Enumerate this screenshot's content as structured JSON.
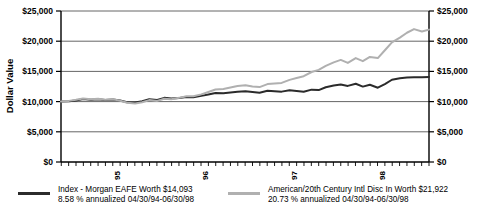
{
  "chart_data": {
    "type": "line",
    "title": "",
    "xlabel": "",
    "ylabel": "Dollar Value",
    "ylim": [
      0,
      25000
    ],
    "yticks": [
      0,
      5000,
      10000,
      15000,
      20000,
      25000
    ],
    "ytick_labels": [
      "$0",
      "$5,000",
      "$10,000",
      "$15,000",
      "$20,000",
      "$25,000"
    ],
    "right_axis": {
      "visible": true,
      "ytick_labels": [
        "$0",
        "$5,000",
        "$10,000",
        "$15,000",
        "$20,000",
        "$25,000"
      ]
    },
    "xlim": [
      1994.33,
      1998.5
    ],
    "xticks": [
      1995,
      1996,
      1997,
      1998
    ],
    "xtick_labels": [
      "95",
      "96",
      "97",
      "98"
    ],
    "xtick_rotation": -90,
    "minor_xticks_interval_months": 1,
    "grid": "horizontal",
    "legend_position": "below",
    "period_start": "04/30/94",
    "period_end": "06/30/98",
    "series": [
      {
        "name": "Index - Morgan EAFE",
        "color": "#2b2b2b",
        "width": 2.0,
        "final_value": 14093,
        "annualized_return": "8.58 %",
        "x": [
          1994.33,
          1994.42,
          1994.5,
          1994.58,
          1994.67,
          1994.75,
          1994.83,
          1994.92,
          1995.0,
          1995.08,
          1995.17,
          1995.25,
          1995.33,
          1995.42,
          1995.5,
          1995.58,
          1995.67,
          1995.75,
          1995.83,
          1995.92,
          1996.0,
          1996.08,
          1996.17,
          1996.25,
          1996.33,
          1996.42,
          1996.5,
          1996.58,
          1996.67,
          1996.75,
          1996.83,
          1996.92,
          1997.0,
          1997.08,
          1997.17,
          1997.25,
          1997.33,
          1997.42,
          1997.5,
          1997.58,
          1997.67,
          1997.75,
          1997.83,
          1997.92,
          1998.0,
          1998.08,
          1998.17,
          1998.25,
          1998.33,
          1998.42,
          1998.5
        ],
        "values": [
          10000,
          10050,
          10180,
          10420,
          10300,
          10380,
          10250,
          10330,
          10180,
          9900,
          9850,
          10050,
          10380,
          10280,
          10620,
          10500,
          10600,
          10780,
          10700,
          10950,
          11180,
          11420,
          11380,
          11500,
          11620,
          11700,
          11580,
          11480,
          11800,
          11720,
          11650,
          11880,
          11750,
          11620,
          11980,
          11900,
          12380,
          12680,
          12820,
          12600,
          12950,
          12480,
          12780,
          12300,
          12900,
          13620,
          13850,
          13980,
          14020,
          14050,
          14093
        ]
      },
      {
        "name": "American/20th Century Intl Disc In",
        "color": "#b0b0b0",
        "width": 2.0,
        "final_value": 21922,
        "annualized_return": "20.73 %",
        "x": [
          1994.33,
          1994.42,
          1994.5,
          1994.58,
          1994.67,
          1994.75,
          1994.83,
          1994.92,
          1995.0,
          1995.08,
          1995.17,
          1995.25,
          1995.33,
          1995.42,
          1995.5,
          1995.58,
          1995.67,
          1995.75,
          1995.83,
          1995.92,
          1996.0,
          1996.08,
          1996.17,
          1996.25,
          1996.33,
          1996.42,
          1996.5,
          1996.58,
          1996.67,
          1996.75,
          1996.83,
          1996.92,
          1997.0,
          1997.08,
          1997.17,
          1997.25,
          1997.33,
          1997.42,
          1997.5,
          1997.58,
          1997.67,
          1997.75,
          1997.83,
          1997.92,
          1998.0,
          1998.08,
          1998.17,
          1998.25,
          1998.33,
          1998.42,
          1998.5
        ],
        "values": [
          10000,
          10120,
          10300,
          10520,
          10400,
          10480,
          10320,
          10400,
          10150,
          9800,
          9700,
          9900,
          10250,
          10120,
          10480,
          10400,
          10620,
          10900,
          10880,
          11200,
          11600,
          12000,
          12100,
          12350,
          12600,
          12720,
          12500,
          12400,
          12900,
          13000,
          13100,
          13600,
          13900,
          14200,
          14900,
          15250,
          15900,
          16500,
          16900,
          16400,
          17200,
          16700,
          17400,
          17200,
          18500,
          19800,
          20600,
          21400,
          22000,
          21600,
          21922
        ]
      }
    ]
  },
  "legend": {
    "entries": [
      {
        "line1": "Index - Morgan EAFE Worth $14,093",
        "line2": "8.58 % annualized 04/30/94-06/30/98",
        "swatch_color": "#2b2b2b"
      },
      {
        "line1": "American/20th Century Intl Disc In Worth $21,922",
        "line2": "20.73 % annualized 04/30/94-06/30/98",
        "swatch_color": "#b0b0b0"
      }
    ]
  }
}
